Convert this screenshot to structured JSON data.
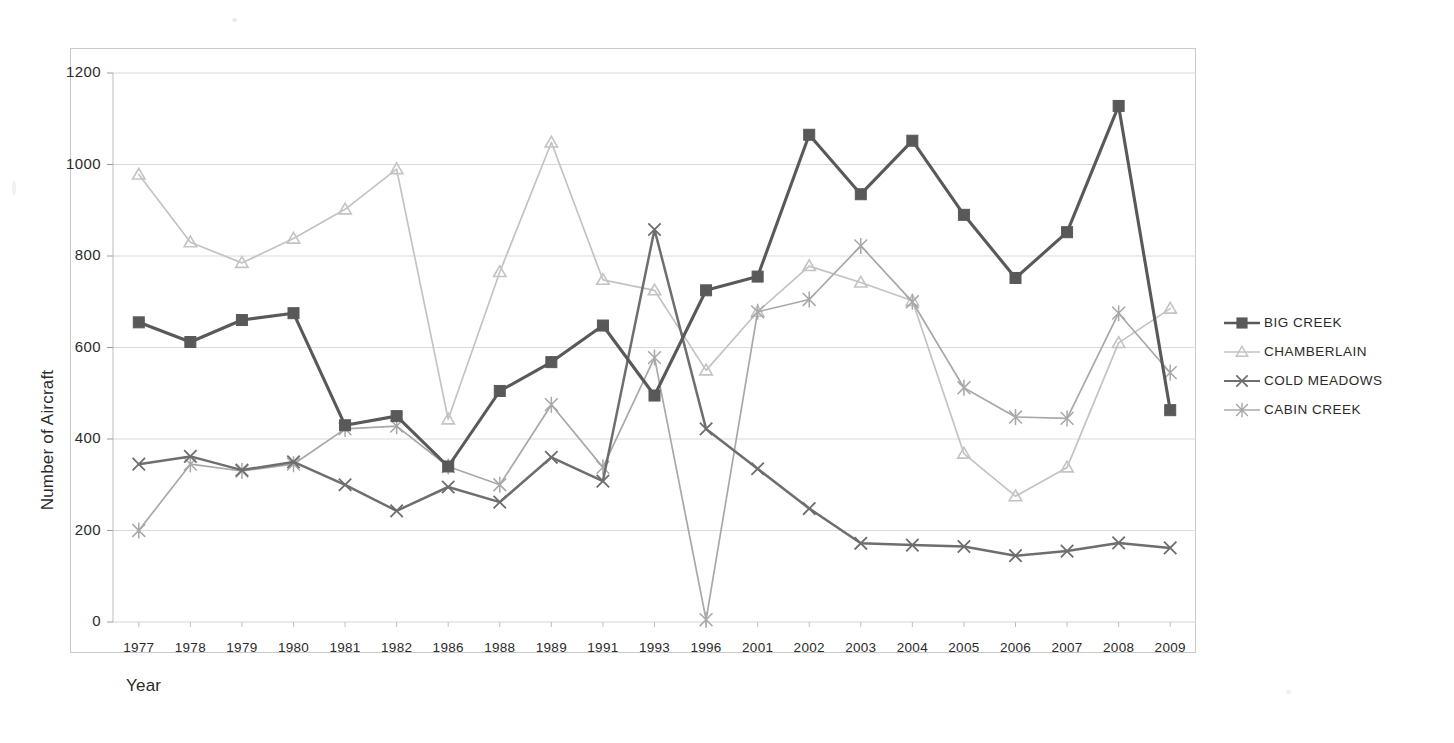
{
  "chart_data": {
    "type": "line",
    "title": "",
    "xlabel": "Year",
    "ylabel": "Number of Aircraft",
    "ylim": [
      0,
      1200
    ],
    "ytick_step": 200,
    "yticks": [
      "1200",
      "1000",
      "800",
      "600",
      "400",
      "200",
      "0"
    ],
    "grid": "horizontal",
    "legend_position": "right",
    "categories": [
      "1977",
      "1978",
      "1979",
      "1980",
      "1981",
      "1982",
      "1986",
      "1988",
      "1989",
      "1991",
      "1993",
      "1996",
      "2001",
      "2002",
      "2003",
      "2004",
      "2005",
      "2006",
      "2007",
      "2008",
      "2009"
    ],
    "series": [
      {
        "name": "BIG CREEK",
        "color": "#595959",
        "marker": "square",
        "values": [
          655,
          612,
          660,
          675,
          430,
          450,
          340,
          505,
          568,
          648,
          495,
          725,
          755,
          1065,
          935,
          1052,
          890,
          752,
          852,
          1128,
          463
        ]
      },
      {
        "name": "CHAMBERLAIN",
        "color": "#c3c3c3",
        "marker": "triangle",
        "values": [
          978,
          830,
          785,
          838,
          902,
          990,
          443,
          765,
          1048,
          748,
          725,
          550,
          678,
          778,
          742,
          702,
          368,
          275,
          338,
          610,
          685
        ]
      },
      {
        "name": "COLD MEADOWS",
        "color": "#6e6e6e",
        "marker": "cross",
        "values": [
          345,
          362,
          332,
          350,
          300,
          243,
          295,
          262,
          360,
          308,
          858,
          422,
          335,
          248,
          172,
          168,
          165,
          145,
          155,
          173,
          162
        ]
      },
      {
        "name": "CABIN CREEK",
        "color": "#a8a8a8",
        "marker": "star",
        "values": [
          200,
          345,
          330,
          345,
          422,
          428,
          340,
          300,
          475,
          338,
          578,
          5,
          678,
          705,
          822,
          700,
          512,
          448,
          445,
          675,
          545
        ]
      }
    ]
  },
  "axis": {
    "y_title": "Number of Aircraft",
    "x_title": "Year"
  },
  "legend": {
    "items": [
      {
        "label": "BIG CREEK"
      },
      {
        "label": "CHAMBERLAIN"
      },
      {
        "label": "COLD MEADOWS"
      },
      {
        "label": "CABIN CREEK"
      }
    ]
  }
}
